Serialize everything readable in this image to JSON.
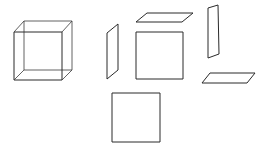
{
  "diagram": {
    "type": "exploded-cube-faces",
    "background": "#ffffff",
    "stroke_color": "#2a2a2a",
    "cube": {
      "front": [
        [
          14,
          32
        ],
        [
          62,
          32
        ],
        [
          62,
          80
        ],
        [
          14,
          80
        ]
      ],
      "back": [
        [
          24,
          21
        ],
        [
          72,
          21
        ],
        [
          72,
          70
        ],
        [
          24,
          70
        ]
      ]
    },
    "faces": [
      {
        "name": "left-face",
        "points": [
          [
            107,
            33
          ],
          [
            118,
            24
          ],
          [
            118,
            70
          ],
          [
            107,
            79
          ]
        ]
      },
      {
        "name": "top-face",
        "points": [
          [
            136,
            22
          ],
          [
            147,
            13
          ],
          [
            193,
            13
          ],
          [
            182,
            22
          ]
        ]
      },
      {
        "name": "front-face",
        "points": [
          [
            136,
            32
          ],
          [
            183,
            32
          ],
          [
            183,
            79
          ],
          [
            136,
            79
          ]
        ]
      },
      {
        "name": "right-face",
        "points": [
          [
            208,
            8
          ],
          [
            218,
            5
          ],
          [
            219,
            54
          ],
          [
            208,
            58
          ]
        ]
      },
      {
        "name": "bottom-face",
        "points": [
          [
            202,
            83
          ],
          [
            210,
            73
          ],
          [
            255,
            73
          ],
          [
            247,
            83
          ]
        ]
      },
      {
        "name": "back-face",
        "points": [
          [
            112,
            93
          ],
          [
            160,
            93
          ],
          [
            160,
            142
          ],
          [
            112,
            142
          ]
        ]
      }
    ]
  }
}
